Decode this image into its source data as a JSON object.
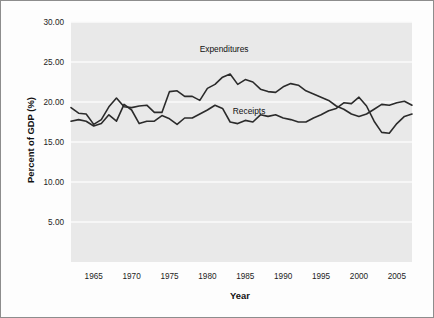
{
  "chart_data": {
    "type": "line",
    "title": "",
    "xlabel": "Year",
    "ylabel": "Percent of GDP (%)",
    "xlim": [
      1962,
      2007
    ],
    "ylim": [
      0,
      30
    ],
    "xticks": [
      1965,
      1970,
      1975,
      1980,
      1985,
      1990,
      1995,
      2000,
      2005
    ],
    "xtick_labels": [
      "1965",
      "1970",
      "1975",
      "1980",
      "1985",
      "1990",
      "1995",
      "2000",
      "2005"
    ],
    "yticks": [
      5,
      10,
      15,
      20,
      25,
      30
    ],
    "ytick_labels": [
      "5.00",
      "10.00",
      "15.00",
      "20.00",
      "25.00",
      "30.00"
    ],
    "grid": true,
    "grid_axis": "y",
    "legend": "inline-annotations",
    "plot_bgcolor": "#e9e9e9",
    "grid_color": "#fafafa",
    "line_color": "#2b2b2b",
    "x": [
      1962,
      1963,
      1964,
      1965,
      1966,
      1967,
      1968,
      1969,
      1970,
      1971,
      1972,
      1973,
      1974,
      1975,
      1976,
      1977,
      1978,
      1979,
      1980,
      1981,
      1982,
      1983,
      1984,
      1985,
      1986,
      1987,
      1988,
      1989,
      1990,
      1991,
      1992,
      1993,
      1994,
      1995,
      1996,
      1997,
      1998,
      1999,
      2000,
      2001,
      2002,
      2003,
      2004,
      2005,
      2006,
      2007
    ],
    "series": [
      {
        "name": "Expenditures",
        "label_position": {
          "x": 1982.2,
          "y": 26.3
        },
        "values": [
          19.3,
          18.6,
          18.5,
          17.2,
          17.8,
          19.4,
          20.5,
          19.4,
          19.3,
          19.5,
          19.6,
          18.7,
          18.7,
          21.3,
          21.4,
          20.7,
          20.7,
          20.2,
          21.7,
          22.2,
          23.1,
          23.5,
          22.2,
          22.8,
          22.5,
          21.6,
          21.3,
          21.2,
          21.9,
          22.3,
          22.1,
          21.4,
          21.0,
          20.6,
          20.2,
          19.5,
          19.1,
          18.5,
          18.2,
          18.5,
          19.1,
          19.7,
          19.6,
          19.9,
          20.1,
          19.6
        ]
      },
      {
        "name": "Receipts",
        "label_position": {
          "x": 1985.5,
          "y": 18.5
        },
        "values": [
          17.6,
          17.8,
          17.6,
          17.0,
          17.3,
          18.4,
          17.6,
          19.7,
          19.0,
          17.3,
          17.6,
          17.6,
          18.3,
          17.9,
          17.2,
          18.0,
          18.0,
          18.5,
          19.0,
          19.6,
          19.2,
          17.5,
          17.3,
          17.7,
          17.5,
          18.4,
          18.2,
          18.4,
          18.0,
          17.8,
          17.5,
          17.5,
          18.0,
          18.4,
          18.9,
          19.2,
          19.9,
          19.8,
          20.6,
          19.5,
          17.6,
          16.2,
          16.1,
          17.3,
          18.2,
          18.5
        ]
      }
    ]
  },
  "axes": {
    "y_title": "Percent of GDP (%)",
    "x_title": "Year"
  },
  "annotations": {
    "expenditures_label": "Expenditures",
    "receipts_label": "Receipts"
  }
}
